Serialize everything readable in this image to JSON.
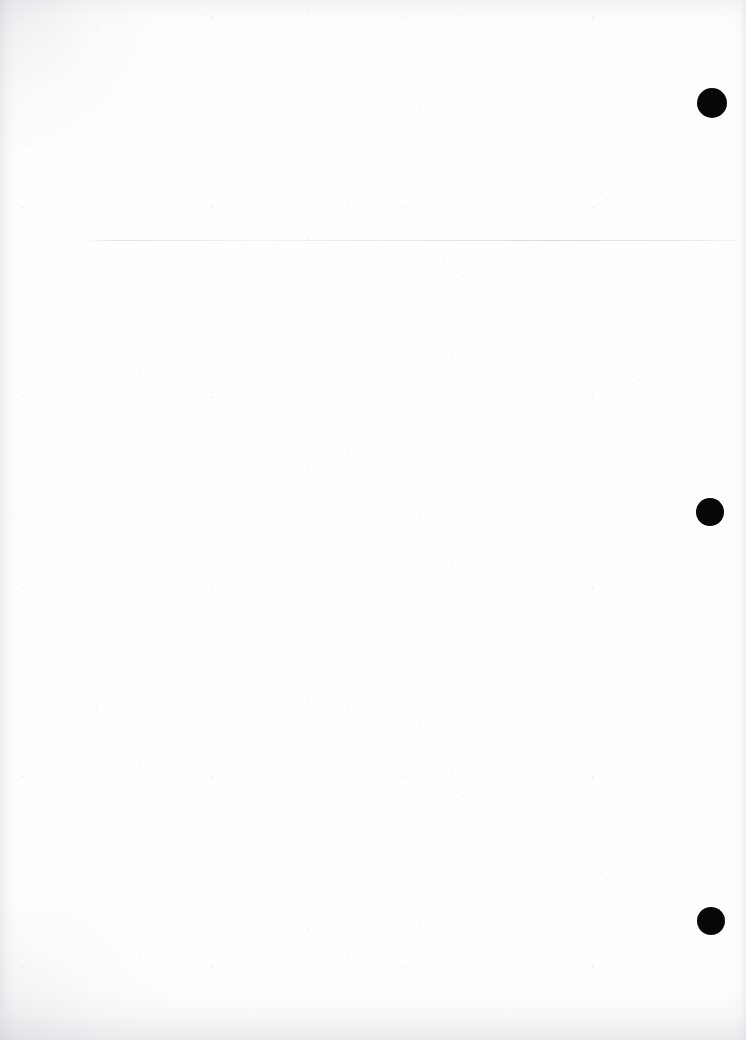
{
  "page": {
    "kind": "scanned-blank-page",
    "width": 746,
    "height": 1040,
    "background_color": "#ffffff",
    "paper_tone": "#fefeff",
    "ink_color": "#070708",
    "content_text": ""
  },
  "rule": {
    "name": "horizontal-rule",
    "color": "#c6c8d0",
    "x": 88,
    "y": 240,
    "width": 648,
    "thickness": 1
  },
  "marks": [
    {
      "label": "mark-1",
      "cx": 712,
      "cy": 103,
      "r": 15,
      "color": "#070708"
    },
    {
      "label": "mark-2",
      "cx": 710,
      "cy": 512,
      "r": 14,
      "color": "#070708"
    },
    {
      "label": "mark-3",
      "cx": 711,
      "cy": 921,
      "r": 14,
      "color": "#070708"
    }
  ]
}
